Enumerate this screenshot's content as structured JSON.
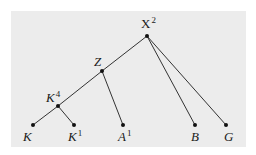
{
  "diagram": {
    "type": "tree",
    "background_color": "#ececec",
    "line_color": "#333333",
    "nodes": [
      {
        "id": "X2",
        "base": "X",
        "sup": "2",
        "x": 147,
        "y": 36,
        "lx": 141,
        "ly": 17,
        "italic": false
      },
      {
        "id": "Z",
        "base": "Z",
        "sup": "",
        "x": 102,
        "y": 71,
        "lx": 94,
        "ly": 55,
        "italic": true
      },
      {
        "id": "K4",
        "base": "K",
        "sup": "4",
        "x": 58,
        "y": 106,
        "lx": 46,
        "ly": 91,
        "italic": true
      },
      {
        "id": "K",
        "base": "K",
        "sup": "",
        "x": 33,
        "y": 125,
        "lx": 23,
        "ly": 130,
        "italic": true
      },
      {
        "id": "K1",
        "base": "K",
        "sup": "1",
        "x": 74,
        "y": 125,
        "lx": 68,
        "ly": 130,
        "italic": true
      },
      {
        "id": "A1",
        "base": "A",
        "sup": "1",
        "x": 123,
        "y": 125,
        "lx": 118,
        "ly": 130,
        "italic": true
      },
      {
        "id": "B",
        "base": "B",
        "sup": "",
        "x": 195,
        "y": 125,
        "lx": 191,
        "ly": 130,
        "italic": true
      },
      {
        "id": "G",
        "base": "G",
        "sup": "",
        "x": 226,
        "y": 125,
        "lx": 224,
        "ly": 130,
        "italic": true
      }
    ],
    "edges": [
      [
        "X2",
        "Z"
      ],
      [
        "X2",
        "B"
      ],
      [
        "X2",
        "G"
      ],
      [
        "Z",
        "K4"
      ],
      [
        "Z",
        "A1"
      ],
      [
        "K4",
        "K"
      ],
      [
        "K4",
        "K1"
      ]
    ]
  }
}
